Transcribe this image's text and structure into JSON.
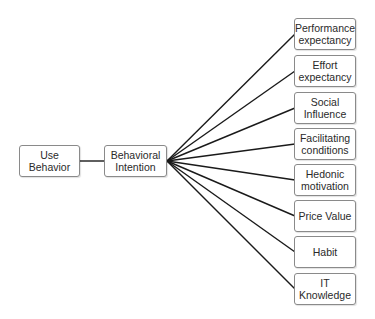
{
  "diagram": {
    "left_nodes": [
      {
        "id": "use_behavior",
        "label": "Use\nBehavior"
      },
      {
        "id": "behavioral_intention",
        "label": "Behavioral\nIntention"
      }
    ],
    "right_nodes": [
      {
        "id": "performance_expectancy",
        "label": "Performance\nexpectancy"
      },
      {
        "id": "effort_expectancy",
        "label": "Effort\nexpectancy"
      },
      {
        "id": "social_influence",
        "label": "Social\nInfluence"
      },
      {
        "id": "facilitating_conditions",
        "label": "Facilitating\nconditions"
      },
      {
        "id": "hedonic_motivation",
        "label": "Hedonic\nmotivation"
      },
      {
        "id": "price_value",
        "label": "Price Value"
      },
      {
        "id": "habit",
        "label": "Habit"
      },
      {
        "id": "it_knowledge",
        "label": "IT\nKnowledge"
      }
    ],
    "edges": [
      [
        "use_behavior",
        "behavioral_intention"
      ],
      [
        "behavioral_intention",
        "performance_expectancy"
      ],
      [
        "behavioral_intention",
        "effort_expectancy"
      ],
      [
        "behavioral_intention",
        "social_influence"
      ],
      [
        "behavioral_intention",
        "facilitating_conditions"
      ],
      [
        "behavioral_intention",
        "hedonic_motivation"
      ],
      [
        "behavioral_intention",
        "price_value"
      ],
      [
        "behavioral_intention",
        "habit"
      ],
      [
        "behavioral_intention",
        "it_knowledge"
      ]
    ],
    "colors": {
      "line": "#1a1a1a",
      "border": "#8a8a8a",
      "text": "#2a2a2a"
    }
  }
}
